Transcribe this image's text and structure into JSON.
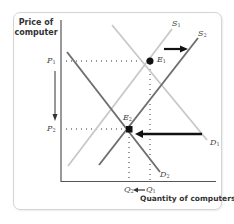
{
  "diagram": {
    "y_axis_label": "Price of computer",
    "x_axis_label": "Quantity of computers",
    "prices": {
      "p1": {
        "symbol": "P",
        "sub": "1"
      },
      "p2": {
        "symbol": "P",
        "sub": "2"
      }
    },
    "quantities": {
      "q1": {
        "symbol": "Q",
        "sub": "1"
      },
      "q2": {
        "symbol": "Q",
        "sub": "2"
      },
      "arrow": "←"
    },
    "curves": {
      "s1": {
        "symbol": "S",
        "sub": "1",
        "color": "#c8c8c8"
      },
      "s2": {
        "symbol": "S",
        "sub": "2",
        "color": "#6e6e6e"
      },
      "d1": {
        "symbol": "D",
        "sub": "1",
        "color": "#c8c8c8"
      },
      "d2": {
        "symbol": "D",
        "sub": "2",
        "color": "#6e6e6e"
      }
    },
    "equilibria": {
      "e1": {
        "symbol": "E",
        "sub": "1"
      },
      "e2": {
        "symbol": "E",
        "sub": "2"
      }
    },
    "colors": {
      "axis": "#555555",
      "arrow": "#111111",
      "frame": "#d4d4d4"
    }
  }
}
